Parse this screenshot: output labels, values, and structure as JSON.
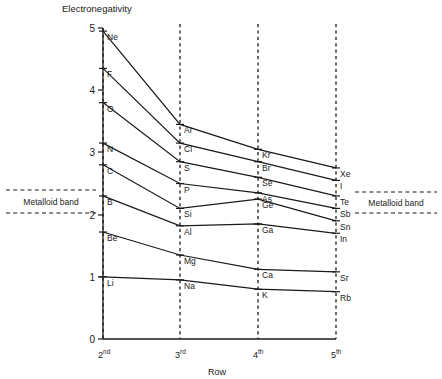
{
  "chart_data": {
    "type": "line",
    "title": "",
    "ylabel": "Electronegativity",
    "xlabel": "Row",
    "categories": [
      "2nd",
      "3rd",
      "4th",
      "5th"
    ],
    "x": [
      1,
      2,
      3,
      4
    ],
    "ylim": [
      0,
      5
    ],
    "yticks": [
      0,
      1,
      2,
      3,
      4,
      5
    ],
    "ytick_labels": [
      "0",
      "1",
      "2",
      "3",
      "4",
      "5"
    ],
    "xtick_labels": [
      "2",
      "3",
      "4",
      "5"
    ],
    "xtick_suffixes": [
      "nd",
      "rd",
      "th",
      "th"
    ],
    "grid": "vertical-dashed",
    "legend": "none",
    "series": [
      {
        "name": "Group 18",
        "labels": [
          "Ne",
          "Ar",
          "Kr",
          "Xe"
        ],
        "values": [
          4.95,
          3.45,
          3.05,
          2.75
        ]
      },
      {
        "name": "Group 17",
        "labels": [
          "F",
          "Cl",
          "Br",
          "I"
        ],
        "values": [
          4.35,
          3.15,
          2.85,
          2.55
        ]
      },
      {
        "name": "Group 16",
        "labels": [
          "O",
          "S",
          "Se",
          "Te"
        ],
        "values": [
          3.8,
          2.85,
          2.6,
          2.3
        ]
      },
      {
        "name": "Group 15",
        "labels": [
          "N",
          "P",
          "As",
          "Sb"
        ],
        "values": [
          3.15,
          2.5,
          2.35,
          2.1
        ]
      },
      {
        "name": "Group 14",
        "labels": [
          "C",
          "Si",
          "Ge",
          "Sn"
        ],
        "values": [
          2.8,
          2.1,
          2.25,
          1.9
        ]
      },
      {
        "name": "Group 13",
        "labels": [
          "B",
          "Al",
          "Ga",
          "In"
        ],
        "values": [
          2.3,
          1.82,
          1.85,
          1.7
        ]
      },
      {
        "name": "Group 2",
        "labels": [
          "Be",
          "Mg",
          "Ca",
          "Sr"
        ],
        "values": [
          1.72,
          1.35,
          1.12,
          1.08
        ]
      },
      {
        "name": "Group 1",
        "labels": [
          "Li",
          "Na",
          "K",
          "Rb"
        ],
        "values": [
          1.0,
          0.95,
          0.8,
          0.76
        ]
      }
    ],
    "annotations": [
      {
        "name": "metalloid-band-left",
        "label": "Metalloid band",
        "y_top": 2.38,
        "y_bottom": 2.02,
        "side": "left"
      },
      {
        "name": "metalloid-band-right",
        "label": "Metalloid band",
        "y_top": 2.35,
        "y_bottom": 2.02,
        "side": "right"
      }
    ]
  }
}
